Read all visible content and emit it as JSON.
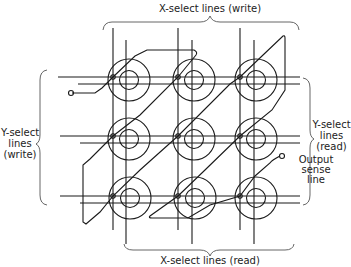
{
  "diagram": {
    "labels": {
      "top": "X-select lines (write)",
      "bottom": "X-select lines (read)",
      "left": [
        "Y-select",
        "lines",
        "(write)"
      ],
      "right": [
        "Y-select",
        "lines",
        "(read)"
      ],
      "sense": [
        "Output",
        "sense",
        "line"
      ]
    },
    "grid": {
      "rows": 3,
      "cols": 3
    },
    "cores": [
      {
        "row": 1,
        "col": 1
      },
      {
        "row": 1,
        "col": 2
      },
      {
        "row": 1,
        "col": 3
      },
      {
        "row": 2,
        "col": 1
      },
      {
        "row": 2,
        "col": 2
      },
      {
        "row": 2,
        "col": 3
      },
      {
        "row": 3,
        "col": 1
      },
      {
        "row": 3,
        "col": 2
      },
      {
        "row": 3,
        "col": 3
      }
    ]
  }
}
